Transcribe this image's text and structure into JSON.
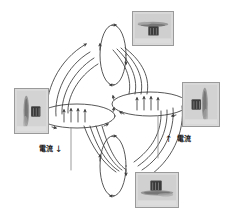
{
  "figure": {
    "background_color": "#ffffff",
    "line_color": "#3a3a3a",
    "inset_border_color": "#9a9a9a",
    "inset_fill_color": "#d8d8d8"
  },
  "labels": {
    "current_left": {
      "text": "電流",
      "arrow": "↓",
      "direction": "down"
    },
    "current_right": {
      "text": "電流",
      "arrow": "↑",
      "direction": "up"
    }
  },
  "coils": [
    {
      "name": "left-coil",
      "cx": 77,
      "cy": 116,
      "rx": 38,
      "ry": 12,
      "interior_arrows": 4,
      "interior_arrow_direction": "up"
    },
    {
      "name": "right-coil",
      "cx": 150,
      "cy": 104,
      "rx": 38,
      "ry": 12,
      "interior_arrows": 4,
      "interior_arrow_direction": "up"
    }
  ],
  "loops": [
    {
      "name": "top-loop",
      "cx": 113,
      "cy": 55,
      "rx": 13,
      "ry": 30
    },
    {
      "name": "bottom-loop",
      "cx": 113,
      "cy": 166,
      "rx": 13,
      "ry": 30
    }
  ],
  "leads": [
    {
      "name": "left-lead",
      "x": 71,
      "y1": 128,
      "y2": 170
    },
    {
      "name": "right-lead",
      "x": 158,
      "y1": 116,
      "y2": 158
    }
  ],
  "insets": [
    {
      "name": "inset-top-right",
      "caption": "",
      "x": 132,
      "y": 11,
      "w": 42,
      "h": 35,
      "subject": "iron-filings-on-rod-horizontal"
    },
    {
      "name": "inset-right",
      "caption": "",
      "x": 182,
      "y": 82,
      "w": 38,
      "h": 45,
      "subject": "iron-filings-on-rod-vertical"
    },
    {
      "name": "inset-left",
      "caption": "",
      "x": 14,
      "y": 88,
      "w": 35,
      "h": 46,
      "subject": "iron-filings-on-rod-vertical"
    },
    {
      "name": "inset-bottom-right",
      "caption": "",
      "x": 135,
      "y": 172,
      "w": 44,
      "h": 36,
      "subject": "iron-filings-on-rod-horizontal"
    }
  ]
}
